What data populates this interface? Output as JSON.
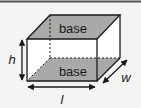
{
  "diagram": {
    "faces": {
      "top_label": "base",
      "bottom_label": "base"
    },
    "dimensions": {
      "height": "h",
      "length": "l",
      "width": "w"
    },
    "colors": {
      "background": "#f4f4f2",
      "base_fill": "#a9a9a9",
      "edge": "#1a1a1a",
      "side_fill": "#ffffff",
      "top_rule": "#555555"
    }
  }
}
